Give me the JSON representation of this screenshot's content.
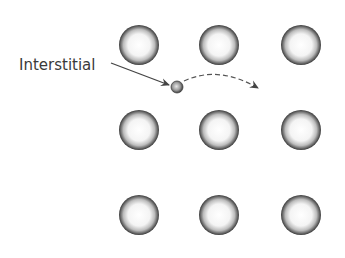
{
  "diagram": {
    "label": "Interstitial",
    "lattice_atoms": [
      {
        "row": 0,
        "col": 0,
        "cx": 139,
        "cy": 45
      },
      {
        "row": 0,
        "col": 1,
        "cx": 219,
        "cy": 45
      },
      {
        "row": 0,
        "col": 2,
        "cx": 301,
        "cy": 45
      },
      {
        "row": 1,
        "col": 0,
        "cx": 139,
        "cy": 130
      },
      {
        "row": 1,
        "col": 1,
        "cx": 219,
        "cy": 130
      },
      {
        "row": 1,
        "col": 2,
        "cx": 301,
        "cy": 130
      },
      {
        "row": 2,
        "col": 0,
        "cx": 139,
        "cy": 215
      },
      {
        "row": 2,
        "col": 1,
        "cx": 219,
        "cy": 215
      },
      {
        "row": 2,
        "col": 2,
        "cx": 301,
        "cy": 215
      }
    ],
    "lattice_radius": 20,
    "interstitial_atom": {
      "cx": 177,
      "cy": 87,
      "r": 6
    },
    "colors": {
      "atom_edge": "#444444",
      "atom_center": "#ffffff",
      "arrow": "#444444",
      "text": "#3a3a3a"
    }
  }
}
